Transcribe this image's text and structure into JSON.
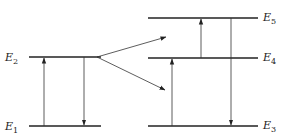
{
  "diagram": {
    "type": "energy-level-diagram",
    "left_system": {
      "levels": [
        {
          "id": "E2",
          "label": "E",
          "subscript": "2",
          "y": 57,
          "x1": 29,
          "x2": 101
        },
        {
          "id": "E1",
          "label": "E",
          "subscript": "1",
          "y": 126,
          "x1": 29,
          "x2": 101
        }
      ],
      "transitions": [
        {
          "from": "E1",
          "to": "E2",
          "direction": "up",
          "x": 44
        },
        {
          "from": "E2",
          "to": "E1",
          "direction": "down",
          "x": 84
        }
      ]
    },
    "transfer_arrows": [
      {
        "from": "E2",
        "to": "E5-region",
        "x1": 97,
        "y1": 57,
        "x2": 166,
        "y2": 37
      },
      {
        "from": "E2",
        "to": "E4-region",
        "x1": 97,
        "y1": 57,
        "x2": 165,
        "y2": 90
      }
    ],
    "right_system": {
      "levels": [
        {
          "id": "E5",
          "label": "E",
          "subscript": "5",
          "y": 18,
          "x1": 148,
          "x2": 258
        },
        {
          "id": "E4",
          "label": "E",
          "subscript": "4",
          "y": 58,
          "x1": 148,
          "x2": 258
        },
        {
          "id": "E3",
          "label": "E",
          "subscript": "3",
          "y": 126,
          "x1": 148,
          "x2": 258
        }
      ],
      "transitions": [
        {
          "from": "E3",
          "to": "E4",
          "direction": "up",
          "x": 172
        },
        {
          "from": "E4",
          "to": "E5",
          "direction": "up",
          "x": 201
        },
        {
          "from": "E5",
          "to": "E3",
          "direction": "down",
          "x": 231
        }
      ]
    }
  }
}
